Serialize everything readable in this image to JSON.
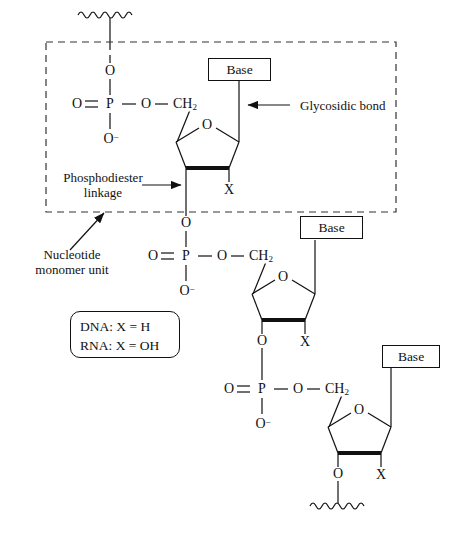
{
  "figure": {
    "type": "chemical-structure-diagram",
    "background_color": "#ffffff",
    "line_color": "#111111"
  },
  "annotations": {
    "glycosidic_bond": "Glycosidic bond",
    "phosphodiester_line1": "Phosphodiester",
    "phosphodiester_line2": "linkage",
    "nucleotide_line1": "Nucleotide",
    "nucleotide_line2": "monomer unit"
  },
  "legend": {
    "dna": "DNA: X = H",
    "rna": "RNA: X = OH"
  },
  "base_boxes": [
    {
      "label": "Base"
    },
    {
      "label": "Base"
    },
    {
      "label": "Base"
    }
  ],
  "units": [
    {
      "phosphate": {
        "o_top": "O",
        "o_double_left": "O",
        "p": "P",
        "o_ester": "O",
        "o_minus": "O",
        "o_minus_charge": "−"
      },
      "sugar": {
        "ch2": "CH",
        "ch2_sub": "2",
        "ring_oxygen": "O",
        "x_substituent": "X"
      }
    },
    {
      "phosphate": {
        "o_top": "O",
        "o_double_left": "O",
        "p": "P",
        "o_ester": "O",
        "o_minus": "O",
        "o_minus_charge": "−"
      },
      "sugar": {
        "ch2": "CH",
        "ch2_sub": "2",
        "ring_oxygen": "O",
        "x_substituent": "X",
        "o_link_below": "O"
      }
    },
    {
      "phosphate": {
        "o_top": "O",
        "o_double_left": "O",
        "p": "P",
        "o_ester": "O",
        "o_minus": "O",
        "o_minus_charge": "−"
      },
      "sugar": {
        "ch2": "CH",
        "ch2_sub": "2",
        "ring_oxygen": "O",
        "x_substituent": "X",
        "o_link_below": "O"
      }
    }
  ],
  "chain_termini": {
    "top": "wavy-bond-squiggle",
    "bottom": "wavy-bond-squiggle"
  },
  "dashed_region": {
    "name": "nucleotide-monomer-unit-outline",
    "style": "dashed"
  }
}
